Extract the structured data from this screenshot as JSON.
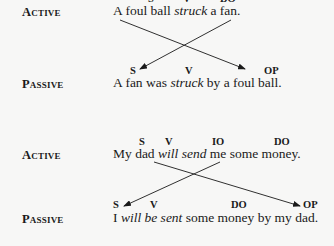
{
  "example1": {
    "active": {
      "label": "Active",
      "tags": [
        "S",
        "V",
        "DO"
      ],
      "sentence_parts": [
        "A foul ball ",
        "struck",
        " a fan."
      ]
    },
    "passive": {
      "label": "Passive",
      "tags": [
        "S",
        "V",
        "OP"
      ],
      "sentence_parts": [
        "A fan was ",
        "struck",
        " by a foul ball."
      ]
    }
  },
  "example2": {
    "active": {
      "label": "Active",
      "tags": [
        "S",
        "V",
        "IO",
        "DO"
      ],
      "sentence_parts": [
        "My dad ",
        "will send",
        " me some money."
      ]
    },
    "passive": {
      "label": "Passive",
      "tags": [
        "S",
        "V",
        "DO",
        "OP"
      ],
      "sentence_parts": [
        "I ",
        "will be sent",
        " some money by my dad."
      ]
    }
  }
}
